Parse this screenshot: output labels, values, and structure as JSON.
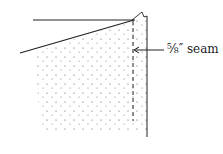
{
  "diagram": {
    "label": "⅝″ seam",
    "stroke_color": "#222222",
    "dot_color": "#555555"
  }
}
